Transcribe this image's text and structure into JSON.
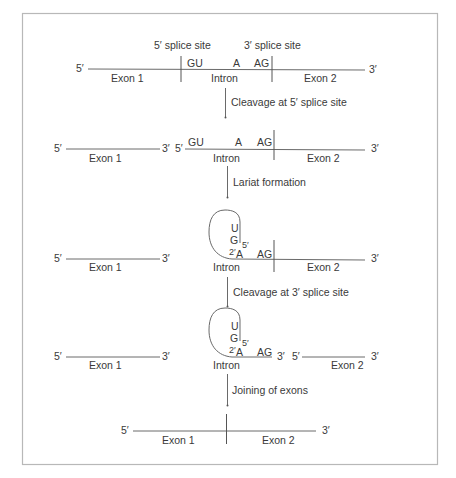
{
  "diagram": {
    "labels": {
      "five_prime": "5′",
      "three_prime": "3′",
      "exon1": "Exon 1",
      "exon2": "Exon 2",
      "intron": "Intron",
      "splice5": "5′ splice site",
      "splice3": "3′ splice site",
      "gu": "GU",
      "a": "A",
      "ag": "AG",
      "u": "U",
      "g": "G",
      "two_prime": "2′",
      "five_prime_small": "5′"
    },
    "steps": [
      {
        "label": "Cleavage at 5′ splice site"
      },
      {
        "label": "Lariat formation"
      },
      {
        "label": "Cleavage at 3′ splice site"
      },
      {
        "label": "Joining of exons"
      }
    ]
  }
}
